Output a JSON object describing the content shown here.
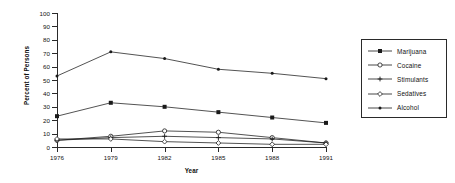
{
  "chart_data": {
    "type": "line",
    "title": "",
    "xlabel": "Year",
    "ylabel": "Percent of Persons",
    "x": [
      1976,
      1979,
      1982,
      1985,
      1988,
      1991
    ],
    "categories": [
      "1976",
      "1979",
      "1982",
      "1985",
      "1988",
      "1991"
    ],
    "xlim": [
      1976,
      1991
    ],
    "ylim": [
      0,
      100
    ],
    "yticks": [
      0,
      10,
      20,
      30,
      40,
      50,
      60,
      70,
      80,
      90,
      100
    ],
    "ytick_labels": [
      "0",
      "10",
      "20",
      "30",
      "40",
      "50",
      "60",
      "70",
      "80",
      "90",
      "100"
    ],
    "grid": false,
    "legend_position": "right-outside",
    "series": [
      {
        "name": "Marijuana",
        "marker": "filled-square",
        "color": "#1a1a1a",
        "values": [
          23,
          33,
          30,
          26,
          22,
          18
        ]
      },
      {
        "name": "Cocaine",
        "marker": "open-circle",
        "color": "#1a1a1a",
        "values": [
          5,
          8,
          12,
          11,
          7,
          3
        ]
      },
      {
        "name": "Stimulants",
        "marker": "plus",
        "color": "#1a1a1a",
        "values": [
          5,
          7,
          8,
          7,
          6,
          3
        ]
      },
      {
        "name": "Sedatives",
        "marker": "open-diamond",
        "color": "#1a1a1a",
        "values": [
          6,
          6,
          4,
          3,
          2,
          2
        ]
      },
      {
        "name": "Alcohol",
        "marker": "filled-dot",
        "color": "#1a1a1a",
        "values": [
          53,
          71,
          66,
          58,
          55,
          51
        ]
      }
    ]
  },
  "axes": {
    "y_title": "Percent of Persons",
    "x_title": "Year"
  },
  "legend": {
    "entries": [
      "Marijuana",
      "Cocaine",
      "Stimulants",
      "Sedatives",
      "Alcohol"
    ]
  },
  "colors": {
    "axis": "#2a2a2a",
    "line": "#1a1a1a",
    "background": "#ffffff"
  }
}
